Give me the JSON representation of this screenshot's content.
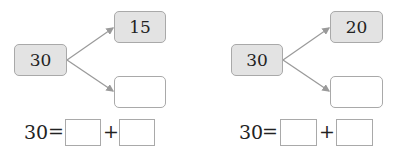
{
  "problems": [
    {
      "whole": "30",
      "part_top": "15",
      "part_bottom": "",
      "equation": {
        "lhs": "30",
        "equals": "=",
        "plus": "+",
        "blank1": "",
        "blank2": ""
      }
    },
    {
      "whole": "30",
      "part_top": "20",
      "part_bottom": "",
      "equation": {
        "lhs": "30",
        "equals": "=",
        "plus": "+",
        "blank1": "",
        "blank2": ""
      }
    }
  ],
  "colors": {
    "filled_box": "#e3e3e3",
    "border": "#a9a9a9",
    "arrow": "#9a9a9a"
  }
}
